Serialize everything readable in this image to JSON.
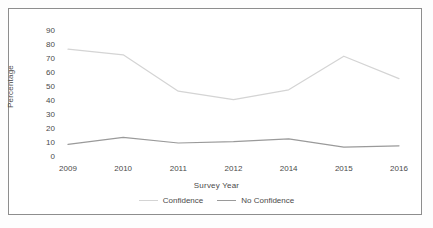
{
  "chart_data": {
    "type": "line",
    "title": "",
    "subtitle": "",
    "xlabel": "Survey Year",
    "ylabel": "Percentage",
    "categories": [
      "2009",
      "2010",
      "2011",
      "2012",
      "2014",
      "2015",
      "2016"
    ],
    "yticks": [
      0,
      10,
      20,
      30,
      40,
      50,
      60,
      70,
      80,
      90
    ],
    "ylim": [
      0,
      90
    ],
    "grid": false,
    "legend_position": "bottom",
    "series": [
      {
        "name": "Confidence",
        "color": "#d4d4d4",
        "values": [
          77,
          73,
          47,
          41,
          48,
          72,
          56
        ]
      },
      {
        "name": "No Confidence",
        "color": "#9a9a9a",
        "values": [
          9,
          14,
          10,
          11,
          13,
          7,
          8
        ]
      }
    ]
  },
  "legend": {
    "items": [
      {
        "label": "Confidence",
        "color": "#d4d4d4"
      },
      {
        "label": "No Confidence",
        "color": "#9a9a9a"
      }
    ]
  },
  "colors": {
    "frame": "#8d8d8d",
    "text": "#4a4a4a",
    "background": "#ffffff"
  }
}
